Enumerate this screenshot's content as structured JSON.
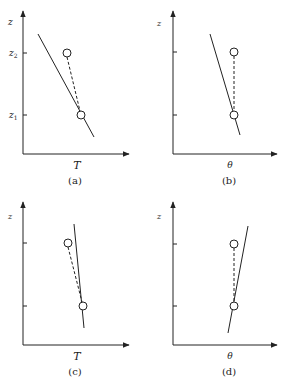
{
  "figure": {
    "stroke_color": "#222222",
    "panels": [
      {
        "id": "a",
        "caption": "(a)",
        "x_label": "T",
        "y_label": "z",
        "tick_labels": [
          "z",
          "z"
        ],
        "tick_subscripts": [
          "2",
          "1"
        ],
        "description": "Environment temperature profile decreasing with height; parcel lifted from z1 to z2 along dashed line ends warmer than environment"
      },
      {
        "id": "b",
        "caption": "(b)",
        "x_label": "θ",
        "y_label": "z",
        "description": "Potential temperature profile decreasing with height; parcel moves vertically at constant θ"
      },
      {
        "id": "c",
        "caption": "(c)",
        "x_label": "T",
        "y_label": "z",
        "description": "Environment temperature nearly constant with height; lifted parcel ends cooler than environment"
      },
      {
        "id": "d",
        "caption": "(d)",
        "x_label": "θ",
        "y_label": "z",
        "description": "Potential temperature profile increasing with height; parcel moves vertically at constant θ"
      }
    ]
  }
}
